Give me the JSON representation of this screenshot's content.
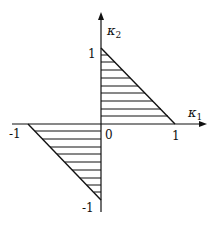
{
  "diagram": {
    "type": "region-plot",
    "axes": {
      "x": {
        "label": "κ",
        "subscript": "1"
      },
      "y": {
        "label": "κ",
        "subscript": "2"
      }
    },
    "ticks": {
      "x_pos": "1",
      "x_neg": "-1",
      "y_pos": "1",
      "y_neg": "-1",
      "origin": "0"
    },
    "regions": [
      {
        "name": "upper-right-triangle",
        "vertices": [
          [
            0,
            0
          ],
          [
            1,
            0
          ],
          [
            0,
            1
          ]
        ],
        "fill": "horizontal-hatch"
      },
      {
        "name": "lower-left-triangle",
        "vertices": [
          [
            0,
            0
          ],
          [
            -1,
            0
          ],
          [
            0,
            -1
          ]
        ],
        "fill": "horizontal-hatch"
      }
    ],
    "colors": {
      "ink": "#111111",
      "background": "#ffffff"
    }
  }
}
